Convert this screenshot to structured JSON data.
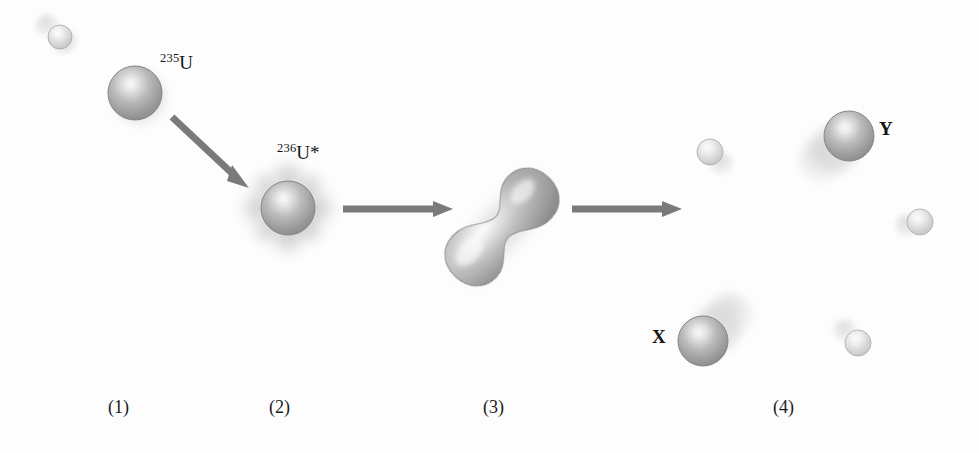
{
  "figure": {
    "background_color": "#fdfdfd",
    "width": 979,
    "height": 453
  },
  "labels": {
    "u235": {
      "sup": "235",
      "symbol": "U",
      "x": 160,
      "y": 52
    },
    "u236": {
      "sup": "236",
      "symbol": "U*",
      "x": 277,
      "y": 142
    },
    "fragment_x": {
      "text": "X",
      "x": 652,
      "y": 327
    },
    "fragment_y": {
      "text": "Y",
      "x": 879,
      "y": 119
    }
  },
  "steps": [
    {
      "text": "(1)",
      "x": 108,
      "y": 398
    },
    {
      "text": "(2)",
      "x": 269,
      "y": 398
    },
    {
      "text": "(3)",
      "x": 483,
      "y": 398
    },
    {
      "text": "(4)",
      "x": 773,
      "y": 398
    }
  ],
  "colors": {
    "sphere_body": "#9a9a9a",
    "sphere_highlight": "#f2f2f2",
    "sphere_edge": "#6f6f6f",
    "neutron_body": "#d9d9d9",
    "neutron_highlight": "#fbfbfb",
    "arrow": "#7a7a7a",
    "aura": "#cfcfcf",
    "text": "#141414",
    "shadow": "#cccccc"
  },
  "scene": {
    "incident_neutron": {
      "name": "incident-neutron",
      "cx": 60,
      "cy": 37,
      "r": 12,
      "trail_dx": -13,
      "trail_dy": -11
    },
    "u235_nucleus": {
      "name": "u235-nucleus",
      "cx": 135,
      "cy": 93,
      "r": 27
    },
    "u236_nucleus": {
      "name": "u236-excited-nucleus",
      "cx": 288,
      "cy": 208,
      "r": 27,
      "aura_r": 39
    },
    "deformed_nucleus": {
      "name": "deformed-nucleus",
      "cx": 502,
      "cy": 227,
      "angle_deg": -47,
      "lobe_r": 30,
      "lobe_offset": 40,
      "neck_halfwidth": 12
    },
    "fragment_x": {
      "name": "fission-fragment-x",
      "cx": 703,
      "cy": 341,
      "r": 25,
      "trail_dx": 26,
      "trail_dy": -24
    },
    "fragment_y": {
      "name": "fission-fragment-y",
      "cx": 849,
      "cy": 136,
      "r": 25,
      "trail_dx": -26,
      "trail_dy": 24
    },
    "emitted_neutrons": [
      {
        "name": "emitted-neutron-1",
        "cx": 710,
        "cy": 152,
        "r": 13,
        "trail_dx": 13,
        "trail_dy": 12
      },
      {
        "name": "emitted-neutron-2",
        "cx": 920,
        "cy": 222,
        "r": 13,
        "trail_dx": -13,
        "trail_dy": 4
      },
      {
        "name": "emitted-neutron-3",
        "cx": 858,
        "cy": 343,
        "r": 13,
        "trail_dx": -13,
        "trail_dy": -12
      }
    ],
    "arrows": [
      {
        "name": "arrow-capture",
        "x1": 172,
        "y1": 117,
        "x2": 245,
        "y2": 185,
        "width": 7
      },
      {
        "name": "arrow-deform",
        "x1": 343,
        "y1": 209,
        "x2": 452,
        "y2": 209,
        "width": 7
      },
      {
        "name": "arrow-split",
        "x1": 572,
        "y1": 209,
        "x2": 681,
        "y2": 209,
        "width": 7
      }
    ]
  }
}
